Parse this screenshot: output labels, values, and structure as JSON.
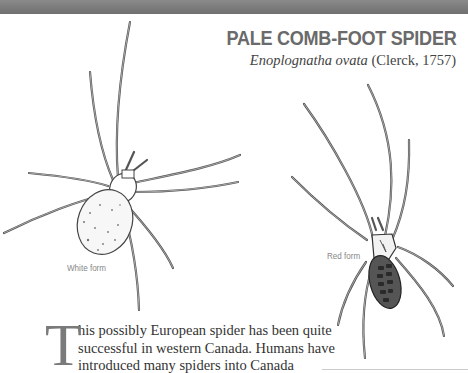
{
  "header": {
    "title": "PALE COMB-FOOT SPIDER",
    "scientific_name": "Enoplognatha ovata",
    "authority": " (Clerck, 1757)"
  },
  "illustrations": [
    {
      "caption": "White form",
      "icon": "spider-white-form-illustration"
    },
    {
      "caption": "Red form",
      "icon": "spider-red-form-illustration"
    }
  ],
  "body": {
    "drop_cap": "T",
    "lines": [
      "his possibly European spider has been quite",
      "successful in western Canada. Humans have",
      "introduced many spiders into Canada"
    ]
  },
  "colors": {
    "band": "#777777",
    "title": "#6a6a6a",
    "text": "#333333"
  }
}
